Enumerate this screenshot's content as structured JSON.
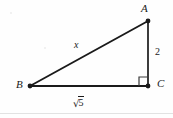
{
  "figure": {
    "kind": "right-triangle-diagram",
    "background_color": "#fefefe",
    "stroke_color": "#1a1a1a",
    "vertices": [
      {
        "name": "A",
        "label": "A",
        "x": 148,
        "y": 21
      },
      {
        "name": "B",
        "label": "B",
        "x": 30,
        "y": 86
      },
      {
        "name": "C",
        "label": "C",
        "x": 148,
        "y": 86
      }
    ],
    "sides": [
      {
        "name": "hypotenuse-BA",
        "from": "B",
        "to": "A",
        "label": "x",
        "label_style": "italic"
      },
      {
        "name": "leg-AC",
        "from": "A",
        "to": "C",
        "label": "2",
        "label_style": "upright"
      },
      {
        "name": "leg-BC",
        "from": "B",
        "to": "C",
        "label": "√5",
        "label_style": "radical",
        "radicand": "5"
      }
    ],
    "right_angle": {
      "at": "C",
      "marker": "square",
      "size": 9
    },
    "labels": {
      "vertex_a": "A",
      "vertex_b": "B",
      "vertex_c": "C",
      "hypotenuse": "x",
      "vertical_leg": "2",
      "horizontal_leg_radical_sign": "√",
      "horizontal_leg_radicand": "5"
    }
  }
}
